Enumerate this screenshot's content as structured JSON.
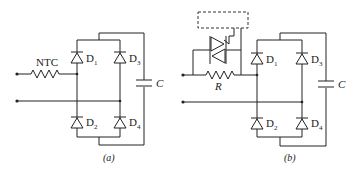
{
  "figure": {
    "panels": [
      {
        "id": "a",
        "caption": "(a)",
        "component_labels": {
          "resistor": "NTC",
          "d1": "D",
          "d1_sub": "1",
          "d2": "D",
          "d2_sub": "2",
          "d3": "D",
          "d3_sub": "3",
          "d4": "D",
          "d4_sub": "4",
          "capacitor": "C"
        }
      },
      {
        "id": "b",
        "caption": "(b)",
        "component_labels": {
          "resistor": "R",
          "d1": "D",
          "d1_sub": "1",
          "d2": "D",
          "d2_sub": "2",
          "d3": "D",
          "d3_sub": "3",
          "d4": "D",
          "d4_sub": "4",
          "capacitor": "C"
        }
      }
    ],
    "colors": {
      "line": "#222222",
      "background": "#ffffff"
    }
  }
}
